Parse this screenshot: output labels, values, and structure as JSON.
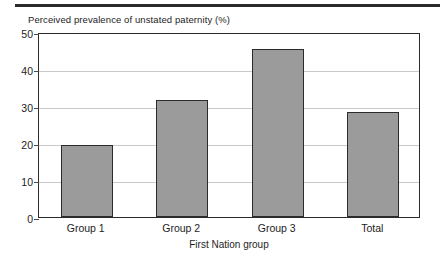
{
  "chart_data": {
    "type": "bar",
    "title": "Perceived prevalence of unstated paternity (%)",
    "xlabel": "First Nation group",
    "ylabel": "Perceived prevalence of unstated paternity (%)",
    "categories": [
      "Group 1",
      "Group 2",
      "Group 3",
      "Total"
    ],
    "values": [
      19.5,
      31.7,
      45.3,
      28.5
    ],
    "ylim": [
      0,
      50
    ],
    "yticks": [
      0,
      10,
      20,
      30,
      40,
      50
    ],
    "ytick_labels": [
      "0",
      "10",
      "20",
      "30",
      "40",
      "50"
    ],
    "grid": true,
    "legend": false,
    "bar_fill_color": "#9b9b9b",
    "bar_edge_color": "#2b2b2b",
    "gridline_color": "#c9c9c9",
    "axis_color": "#2b2b2b",
    "background_color": "#ffffff"
  }
}
